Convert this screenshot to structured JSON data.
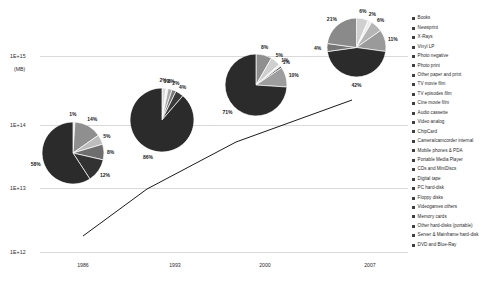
{
  "chart_data": {
    "type": "pie",
    "title": "",
    "xlabel": "",
    "ylabel": "(MB)",
    "y_axis": {
      "unit": "(MB)",
      "scale": "log",
      "ticks": [
        "1E+15",
        "1E+14",
        "1E+13",
        "1E+12"
      ]
    },
    "x_axis": {
      "categories": [
        "1986",
        "1993",
        "2000",
        "2007"
      ]
    },
    "legend": {
      "position": "right",
      "entries": [
        {
          "label": "Books",
          "color": "#3f3f3f"
        },
        {
          "label": "Newsprint",
          "color": "#3f3f3f"
        },
        {
          "label": "X-Rays",
          "color": "#3f3f3f"
        },
        {
          "label": "Vinyl LP",
          "color": "#3f3f3f"
        },
        {
          "label": "Photo negative",
          "color": "#3f3f3f"
        },
        {
          "label": "Photo print",
          "color": "#3f3f3f"
        },
        {
          "label": "Other paper and print",
          "color": "#3f3f3f"
        },
        {
          "label": "TV movie film",
          "color": "#3f3f3f"
        },
        {
          "label": "TV episodes film",
          "color": "#3f3f3f"
        },
        {
          "label": "Cine movie film",
          "color": "#3f3f3f"
        },
        {
          "label": "Audio cassette",
          "color": "#3f3f3f"
        },
        {
          "label": "Video analog",
          "color": "#3f3f3f"
        },
        {
          "label": "ChipCard",
          "color": "#3f3f3f"
        },
        {
          "label": "Camera/camcorder internal",
          "color": "#3f3f3f"
        },
        {
          "label": "Mobile phones & PDA",
          "color": "#3f3f3f"
        },
        {
          "label": "Portable Media Player",
          "color": "#3f3f3f"
        },
        {
          "label": "CDs and MiniDiscs",
          "color": "#3f3f3f"
        },
        {
          "label": "Digital tape",
          "color": "#3f3f3f"
        },
        {
          "label": "PC hard-disk",
          "color": "#3f3f3f"
        },
        {
          "label": "Floppy disks",
          "color": "#3f3f3f"
        },
        {
          "label": "Videogames others",
          "color": "#3f3f3f"
        },
        {
          "label": "Memory cards",
          "color": "#3f3f3f"
        },
        {
          "label": "Other hard-disks (portable)",
          "color": "#3f3f3f"
        },
        {
          "label": "Server & Mainframe hard-disk",
          "color": "#3f3f3f"
        },
        {
          "label": "DVD and Blue-Ray",
          "color": "#3f3f3f"
        }
      ]
    },
    "pies": [
      {
        "year": "1986",
        "labels": [
          "1%",
          "14%",
          "5%",
          "8%",
          "12%",
          "58%"
        ],
        "values": [
          1,
          14,
          5,
          8,
          12,
          58
        ],
        "colors": [
          "#d8d8d8",
          "#8f8f8f",
          "#bdbdbd",
          "#6e6e6e",
          "#323232",
          "#2b2b2b"
        ]
      },
      {
        "year": "1993",
        "labels": [
          "2%",
          "1%",
          "2%",
          "2%",
          "4%",
          "86%"
        ],
        "values": [
          2,
          1,
          2,
          2,
          4,
          86
        ],
        "colors": [
          "#d8d8d8",
          "#efefef",
          "#a8a8a8",
          "#777777",
          "#3a3a3a",
          "#2b2b2b"
        ]
      },
      {
        "year": "2000",
        "labels": [
          "8%",
          "5%",
          "1%",
          "1%",
          "10%",
          "71%"
        ],
        "values": [
          8,
          5,
          1,
          1,
          10,
          71
        ],
        "colors": [
          "#8f8f8f",
          "#cfcfcf",
          "#efefef",
          "#5a5a5a",
          "#9d9d9d",
          "#2b2b2b"
        ]
      },
      {
        "year": "2007",
        "labels": [
          "6%",
          "2%",
          "6%",
          "11%",
          "42%",
          "4%",
          "21%"
        ],
        "values": [
          6,
          2,
          6,
          11,
          42,
          4,
          21
        ],
        "colors": [
          "#d0d0d0",
          "#ededed",
          "#b5b5b5",
          "#9a9a9a",
          "#2b2b2b",
          "#757575",
          "#8a8a8a"
        ]
      }
    ],
    "trend_line": {
      "color": "#1a1a1a",
      "points": [
        [
          83,
          236
        ],
        [
          147,
          189
        ],
        [
          236,
          142
        ],
        [
          352,
          100
        ]
      ]
    }
  }
}
